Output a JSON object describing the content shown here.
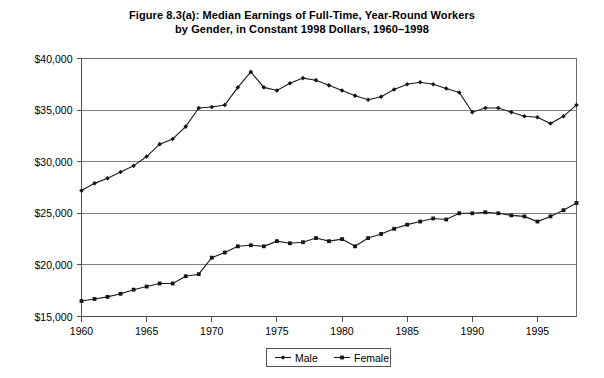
{
  "figure": {
    "title_line1": "Figure 8.3(a): Median Earnings of Full-Time, Year-Round Workers",
    "title_line2": "by Gender, in Constant 1998 Dollars, 1960–1998"
  },
  "legend": {
    "position": "bottom-center",
    "entries": [
      {
        "label": "Male",
        "marker": "filled-diamond"
      },
      {
        "label": "Female",
        "marker": "filled-square"
      }
    ]
  },
  "axes": {
    "y_ticks": [
      "$15,000",
      "$20,000",
      "$25,000",
      "$30,000",
      "$35,000",
      "$40,000"
    ],
    "x_ticks": [
      "1960",
      "1965",
      "1970",
      "1975",
      "1980",
      "1985",
      "1990",
      "1995"
    ]
  },
  "colors": {
    "series_male": "#1a1a1a",
    "series_female": "#1a1a1a",
    "grid": "#808080",
    "axis": "#4d4d4d",
    "background": "#ffffff"
  },
  "chart_data": {
    "type": "line",
    "title": "Figure 8.3(a): Median Earnings of Full-Time, Year-Round Workers by Gender, in Constant 1998 Dollars, 1960–1998",
    "xlabel": "",
    "ylabel": "",
    "xlim": [
      1960,
      1998
    ],
    "ylim": [
      15000,
      40000
    ],
    "y_tick_values": [
      15000,
      20000,
      25000,
      30000,
      35000,
      40000
    ],
    "x_tick_values": [
      1960,
      1965,
      1970,
      1975,
      1980,
      1985,
      1990,
      1995
    ],
    "grid": "horizontal",
    "legend_position": "bottom-center",
    "x": [
      1960,
      1961,
      1962,
      1963,
      1964,
      1965,
      1966,
      1967,
      1968,
      1969,
      1970,
      1971,
      1972,
      1973,
      1974,
      1975,
      1976,
      1977,
      1978,
      1979,
      1980,
      1981,
      1982,
      1983,
      1984,
      1985,
      1986,
      1987,
      1988,
      1989,
      1990,
      1991,
      1992,
      1993,
      1994,
      1995,
      1996,
      1997,
      1998
    ],
    "series": [
      {
        "name": "Male",
        "values": [
          27200,
          27900,
          28400,
          29000,
          29600,
          30500,
          31700,
          32200,
          33400,
          35200,
          35300,
          35500,
          37200,
          38700,
          37200,
          36900,
          37600,
          38100,
          37900,
          37400,
          36900,
          36400,
          36000,
          36300,
          37000,
          37500,
          37700,
          37500,
          37100,
          36700,
          34800,
          35200,
          35200,
          34800,
          34400,
          34300,
          33700,
          34400,
          35500
        ]
      },
      {
        "name": "Female",
        "values": [
          16500,
          16700,
          16900,
          17200,
          17600,
          17900,
          18200,
          18200,
          18900,
          19100,
          20700,
          21200,
          21800,
          21900,
          21800,
          22300,
          22100,
          22200,
          22600,
          22300,
          22500,
          21800,
          22600,
          23000,
          23500,
          23900,
          24200,
          24500,
          24400,
          25000,
          25000,
          25100,
          25000,
          24800,
          24700,
          24200,
          24700,
          25300,
          26000
        ]
      }
    ]
  }
}
